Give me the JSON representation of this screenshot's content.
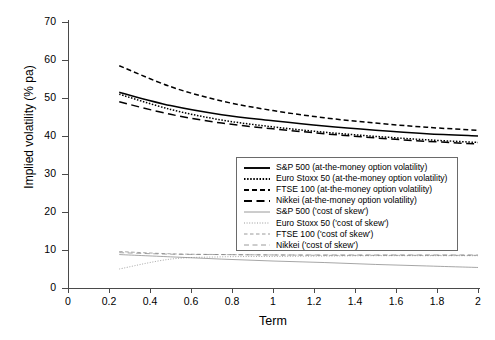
{
  "chart_data": {
    "type": "line",
    "title": "",
    "xlabel": "Term",
    "ylabel": "Implied volatility (% pa)",
    "xlim": [
      0,
      2
    ],
    "ylim": [
      0,
      70
    ],
    "xticks": [
      "0",
      "0.2",
      "0.4",
      "0.6",
      "0.8",
      "1",
      "1.2",
      "1.4",
      "1.6",
      "1.8",
      "2"
    ],
    "yticks": [
      "0",
      "10",
      "20",
      "30",
      "40",
      "50",
      "60",
      "70"
    ],
    "grid": false,
    "legend_position": "center-right inside axes",
    "x": [
      0.25,
      0.5,
      0.75,
      1.0,
      1.25,
      1.5,
      1.75,
      2.0
    ],
    "series": [
      {
        "name": "S&P 500 (at-the-money option volatility)",
        "style": "solid",
        "weight": "bold",
        "color": "#000000",
        "values": [
          51.5,
          48.0,
          45.6,
          44.0,
          42.6,
          41.5,
          40.6,
          40.0
        ]
      },
      {
        "name": "Euro Stoxx 50 (at-the-money option volatility)",
        "style": "dotted",
        "weight": "bold",
        "color": "#000000",
        "values": [
          51.0,
          47.0,
          44.2,
          42.4,
          41.0,
          39.9,
          39.0,
          38.3
        ]
      },
      {
        "name": "FTSE 100 (at-the-money option volatility)",
        "style": "dashed-short",
        "weight": "bold",
        "color": "#000000",
        "values": [
          58.5,
          53.0,
          49.2,
          46.7,
          44.8,
          43.4,
          42.3,
          41.5
        ]
      },
      {
        "name": "Nikkei (at-the-money option volatility)",
        "style": "dashed-long",
        "weight": "bold",
        "color": "#000000",
        "values": [
          49.0,
          45.7,
          43.4,
          41.9,
          40.6,
          39.5,
          38.6,
          37.9
        ]
      },
      {
        "name": "S&P 500 ('cost of skew')",
        "style": "solid",
        "weight": "thin",
        "color": "#808080",
        "values": [
          8.8,
          8.2,
          7.6,
          7.1,
          6.7,
          6.2,
          5.8,
          5.4
        ]
      },
      {
        "name": "Euro Stoxx 50 ('cost of skew')",
        "style": "dotted",
        "weight": "thin",
        "color": "#808080",
        "values": [
          5.0,
          7.6,
          8.2,
          8.3,
          8.4,
          8.5,
          8.5,
          8.5
        ]
      },
      {
        "name": "FTSE 100 ('cost of skew')",
        "style": "dashed-short",
        "weight": "thin",
        "color": "#808080",
        "values": [
          9.6,
          9.0,
          8.8,
          8.7,
          8.6,
          8.6,
          8.6,
          8.6
        ]
      },
      {
        "name": "Nikkei ('cost of skew')",
        "style": "dashed-long",
        "weight": "thin",
        "color": "#808080",
        "values": [
          9.3,
          8.9,
          8.8,
          8.7,
          8.7,
          8.7,
          8.7,
          8.7
        ]
      }
    ]
  },
  "axes": {
    "ylabel": "Implied volatility (% pa)",
    "xlabel": "Term"
  }
}
